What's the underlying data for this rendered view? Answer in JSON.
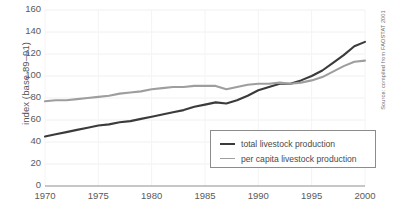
{
  "chart_data": {
    "type": "line",
    "title": "",
    "xlabel": "",
    "ylabel": "index (base 89–91)",
    "source_note": "Source: compiled from FAOSTAT 2001",
    "xlim": [
      1970,
      2000
    ],
    "ylim": [
      0,
      160
    ],
    "grid": true,
    "legend_position": "bottom-right",
    "xticks": [
      1970,
      1975,
      1980,
      1985,
      1990,
      1995,
      2000
    ],
    "xtick_labels": [
      "1970",
      "1975",
      "1980",
      "1985",
      "1990",
      "1995",
      "2000"
    ],
    "yticks": [
      0,
      20,
      40,
      60,
      80,
      100,
      120,
      140,
      160
    ],
    "ytick_labels": [
      "0",
      "20",
      "40",
      "60",
      "80",
      "100",
      "120",
      "140",
      "160"
    ],
    "x": [
      1970,
      1971,
      1972,
      1973,
      1974,
      1975,
      1976,
      1977,
      1978,
      1979,
      1980,
      1981,
      1982,
      1983,
      1984,
      1985,
      1986,
      1987,
      1988,
      1989,
      1990,
      1991,
      1992,
      1993,
      1994,
      1995,
      1996,
      1997,
      1998,
      1999,
      2000
    ],
    "series": [
      {
        "name": "total livestock production",
        "color": "#3b3b3b",
        "line_width": 2.1,
        "values": [
          45,
          47,
          49,
          51,
          53,
          55,
          56,
          58,
          59,
          61,
          63,
          65,
          67,
          69,
          72,
          74,
          76,
          75,
          78,
          82,
          87,
          90,
          93,
          93,
          96,
          100,
          105,
          112,
          119,
          127,
          131
        ]
      },
      {
        "name": "per capita livestock production",
        "color": "#9e9e9e",
        "line_width": 2.1,
        "values": [
          77,
          78,
          78,
          79,
          80,
          81,
          82,
          84,
          85,
          86,
          88,
          89,
          90,
          90,
          91,
          91,
          91,
          88,
          90,
          92,
          93,
          93,
          94,
          93,
          94,
          96,
          99,
          104,
          109,
          113,
          114
        ]
      }
    ],
    "series_end_values": [
      148,
      120
    ]
  },
  "legend": {
    "items": [
      {
        "label": "total livestock production",
        "color": "#3b3b3b"
      },
      {
        "label": "per capita livestock production",
        "color": "#9e9e9e"
      }
    ]
  }
}
